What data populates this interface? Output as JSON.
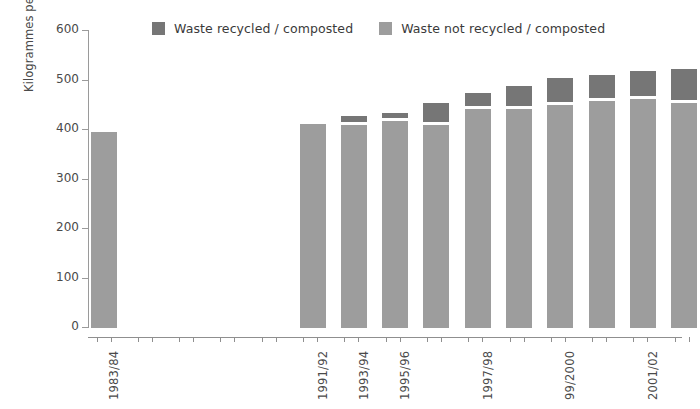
{
  "chart_data": {
    "type": "bar",
    "subtype": "stacked-vertical",
    "title": "",
    "xlabel": "",
    "ylabel": "Kilogrammes per person per year",
    "ylim": [
      0,
      600
    ],
    "yticks": [
      0,
      100,
      200,
      300,
      400,
      500,
      600
    ],
    "ytick_labels": [
      "0",
      "100",
      "200",
      "300",
      "400",
      "500",
      "600"
    ],
    "grid": false,
    "legend_position": "top",
    "categories": [
      "1983/84",
      "1991/92",
      "1993/94",
      "1995/96",
      "1996/97",
      "1997/98",
      "1998/99",
      "99/2000",
      "2000/01",
      "2001/02",
      "2002/03",
      "2003/04"
    ],
    "visible_tick_labels": [
      "1983/84",
      "1991/92",
      "1993/94",
      "1995/96",
      "1997/98",
      "99/2000",
      "2001/02",
      "2003/04"
    ],
    "series": [
      {
        "name": "Waste not recycled / composted",
        "color": "#9d9d9d",
        "values": [
          396,
          412,
          411,
          418,
          410,
          442,
          442,
          450,
          459,
          462,
          455,
          452
        ]
      },
      {
        "name": "Waste recycled / composted",
        "color": "#767676",
        "values": [
          0,
          0,
          12,
          11,
          38,
          27,
          41,
          50,
          46,
          51,
          62,
          60
        ]
      }
    ],
    "totals": [
      396,
      412,
      423,
      429,
      448,
      469,
      483,
      500,
      505,
      513,
      517,
      512
    ],
    "colors": {
      "recycled": "#767676",
      "not_recycled": "#9d9d9d",
      "axis": "#8f8f8f",
      "text": "#4a4a4a",
      "background": "#ffffff"
    }
  },
  "legend": {
    "entries": [
      {
        "label": "Waste recycled / composted",
        "color": "#767676"
      },
      {
        "label": "Waste not recycled / composted",
        "color": "#9d9d9d"
      }
    ]
  },
  "axes": {
    "y": {
      "label": "Kilogrammes per person per year",
      "ticks": [
        {
          "value": 600,
          "label": "600"
        },
        {
          "value": 500,
          "label": "500"
        },
        {
          "value": 400,
          "label": "400"
        },
        {
          "value": 300,
          "label": "300"
        },
        {
          "value": 200,
          "label": "200"
        },
        {
          "value": 100,
          "label": "100"
        },
        {
          "value": 0,
          "label": "0"
        }
      ]
    },
    "x": {
      "labels": [
        {
          "label": "1983/84",
          "index": 0
        },
        {
          "label": "1991/92",
          "index": 1
        },
        {
          "label": "1993/94",
          "index": 2
        },
        {
          "label": "1995/96",
          "index": 3
        },
        {
          "label": "1997/98",
          "index": 5
        },
        {
          "label": "99/2000",
          "index": 7
        },
        {
          "label": "2001/02",
          "index": 9
        },
        {
          "label": "2003/04",
          "index": 11
        }
      ]
    }
  }
}
